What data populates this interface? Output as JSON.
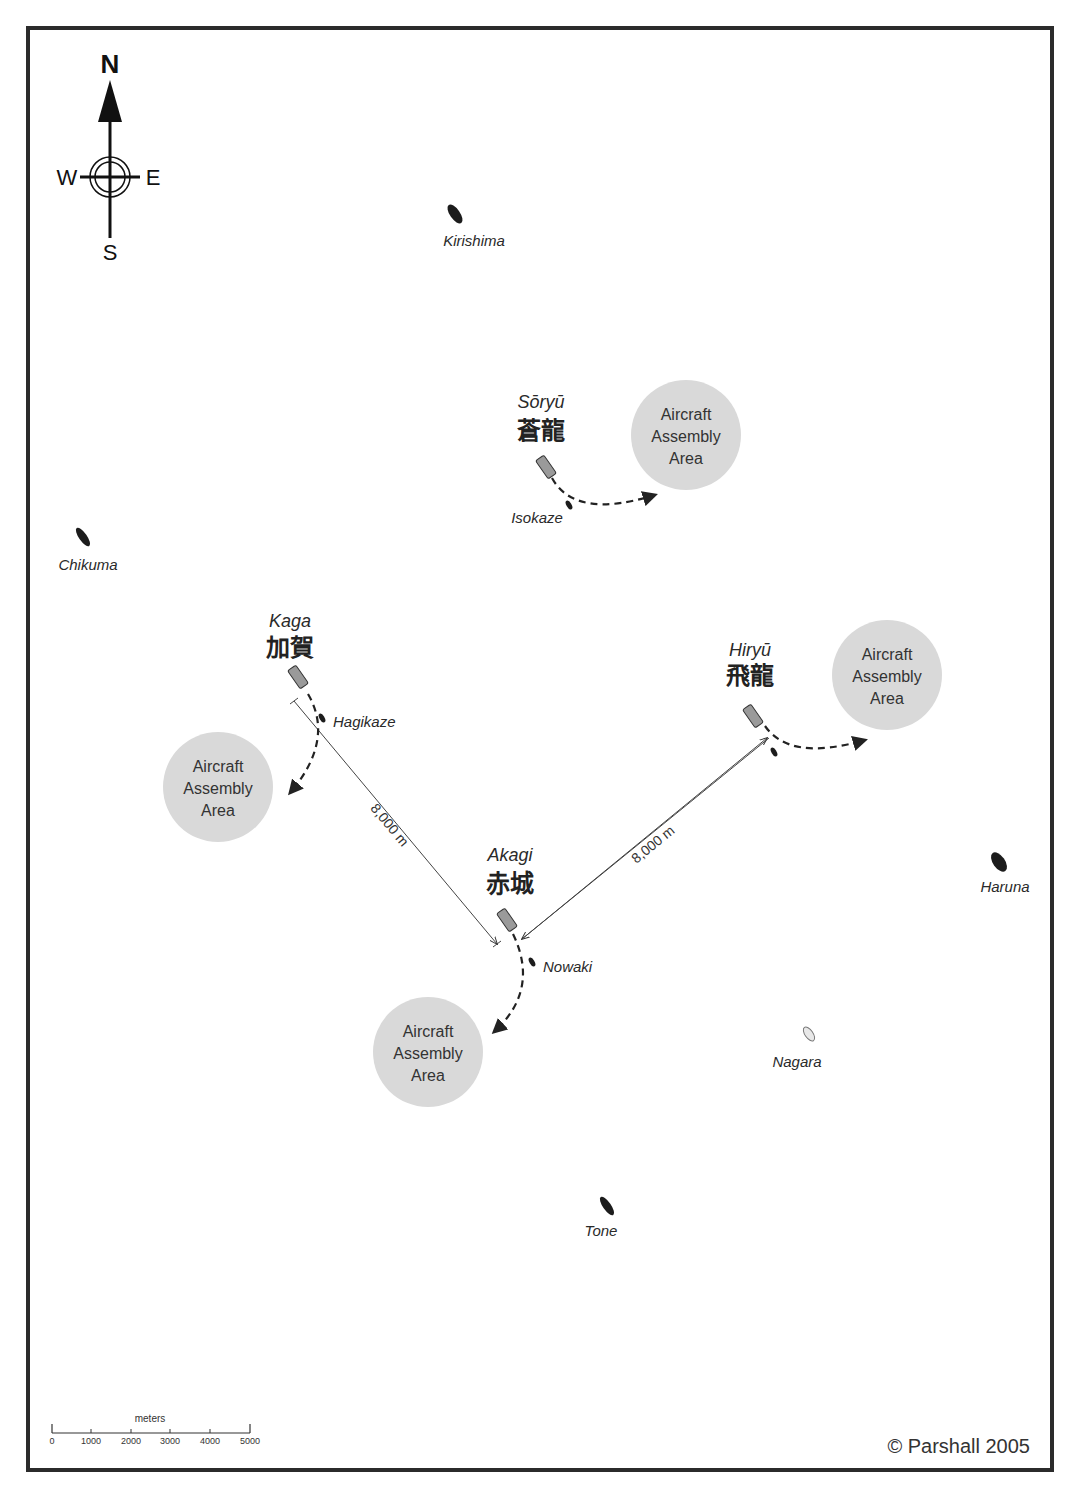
{
  "compass": {
    "n": "N",
    "s": "S",
    "e": "E",
    "w": "W"
  },
  "carriers": [
    {
      "id": "soryu",
      "name": "Sōryū",
      "kanji": "蒼龍"
    },
    {
      "id": "kaga",
      "name": "Kaga",
      "kanji": "加賀"
    },
    {
      "id": "hiryu",
      "name": "Hiryū",
      "kanji": "飛龍"
    },
    {
      "id": "akagi",
      "name": "Akagi",
      "kanji": "赤城"
    }
  ],
  "escorts": [
    {
      "id": "kirishima",
      "name": "Kirishima"
    },
    {
      "id": "chikuma",
      "name": "Chikuma"
    },
    {
      "id": "isokaze",
      "name": "Isokaze"
    },
    {
      "id": "hagikaze",
      "name": "Hagikaze"
    },
    {
      "id": "nowaki",
      "name": "Nowaki"
    },
    {
      "id": "haruna",
      "name": "Haruna"
    },
    {
      "id": "nagara",
      "name": "Nagara"
    },
    {
      "id": "tone",
      "name": "Tone"
    }
  ],
  "assembly_area": {
    "line1": "Aircraft",
    "line2": "Assembly",
    "line3": "Area"
  },
  "distances": {
    "kaga_akagi": "8,000 m",
    "akagi_hiryu": "8,000 m"
  },
  "scale": {
    "title": "meters",
    "ticks": [
      "0",
      "1000",
      "2000",
      "3000",
      "4000",
      "5000"
    ]
  },
  "copyright": "© Parshall 2005",
  "colors": {
    "frame": "#2b2b2b",
    "assembly_fill": "#d9d9d9",
    "ship_dark": "#1c1c1c",
    "carrier_fill": "#9a9a9a",
    "nagara_fill": "#e8e8e8"
  }
}
